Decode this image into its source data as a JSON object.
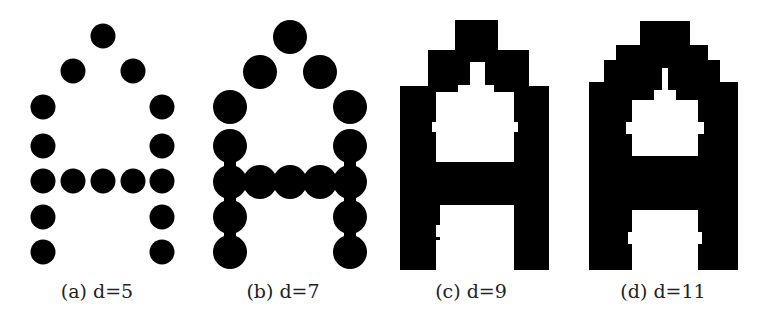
{
  "figure": {
    "ink_color": "#000000",
    "background": "#ffffff",
    "panels": [
      {
        "id": "a",
        "caption": "(a) d=5",
        "d": 5,
        "dot_diameter": 25
      },
      {
        "id": "b",
        "caption": "(b) d=7",
        "d": 7,
        "dot_diameter": 35
      },
      {
        "id": "c",
        "caption": "(c) d=9",
        "d": 9
      },
      {
        "id": "d",
        "caption": "(d) d=11",
        "d": 11
      }
    ]
  }
}
